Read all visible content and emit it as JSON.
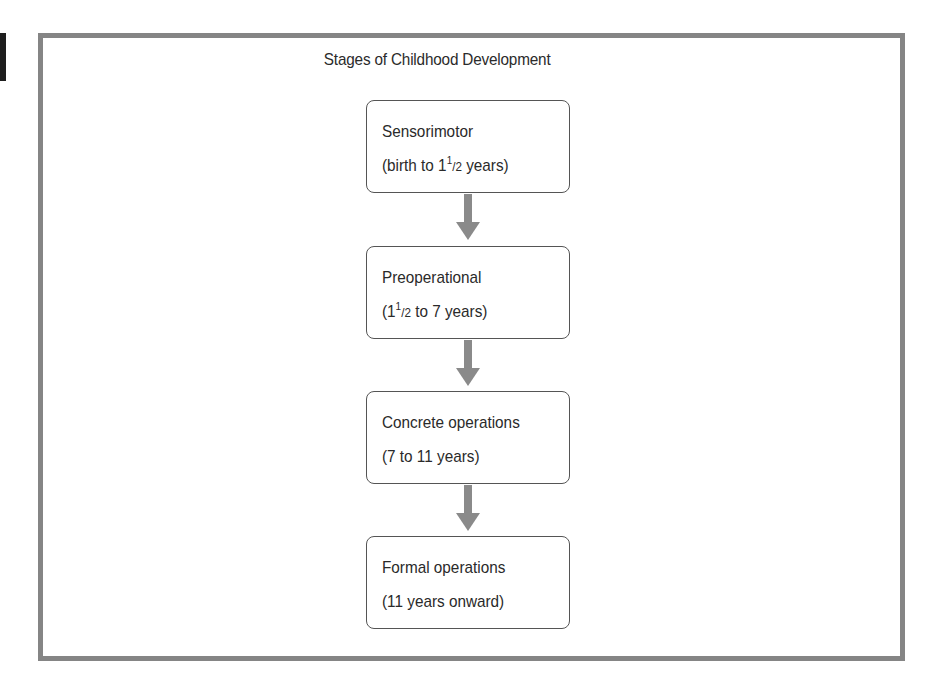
{
  "diagram": {
    "title": "Stages of Childhood Development",
    "stages": [
      {
        "name": "Sensorimotor",
        "age_prefix": "(birth to 1",
        "age_sup": "1",
        "age_frac": "/2",
        "age_suffix": " years)"
      },
      {
        "name": "Preoperational",
        "age_prefix": "(1",
        "age_sup": "1",
        "age_frac": "/2",
        "age_suffix": " to 7 years)"
      },
      {
        "name": "Concrete operations",
        "age_text": "(7 to 11 years)"
      },
      {
        "name": "Formal operations",
        "age_text": "(11 years onward)"
      }
    ],
    "connector": "down-arrow",
    "colors": {
      "frame_border": "#858585",
      "arrow": "#8a8a8a",
      "box_border": "#555555",
      "text": "#2a2a2a"
    }
  }
}
